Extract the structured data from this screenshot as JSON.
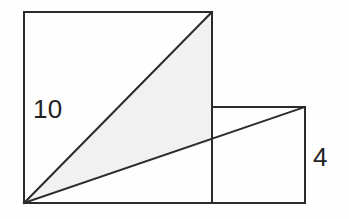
{
  "figure": {
    "kind": "geometry-diagram",
    "canvas": {
      "width": 349,
      "height": 219
    },
    "colors": {
      "background": "#fefefe",
      "stroke": "#2b2b2b",
      "shade_fill": "#f1f1f1",
      "label": "#232323"
    },
    "stroke_width": 2,
    "shapes": {
      "square": {
        "name": "large-square",
        "x": 24,
        "y": 12,
        "width": 188,
        "height": 191,
        "side_label": "10",
        "fill": "none"
      },
      "rectangle": {
        "name": "small-rectangle",
        "x": 212,
        "y": 107,
        "width": 93,
        "height": 96,
        "side_label": "4",
        "fill": "none"
      },
      "shaded_triangle": {
        "name": "shaded-triangle",
        "points": "24,203 212,12 212,141",
        "fill": "#f1f1f1"
      }
    },
    "lines": {
      "square_diagonal": {
        "name": "square-diagonal",
        "x1": 24,
        "y1": 203,
        "x2": 212,
        "y2": 12
      },
      "long_diagonal": {
        "name": "long-diagonal",
        "x1": 24,
        "y1": 203,
        "x2": 305,
        "y2": 107
      },
      "shared_vertical_edge": {
        "name": "shared-vertical-edge",
        "x1": 212,
        "y1": 107,
        "x2": 212,
        "y2": 203
      },
      "baseline": {
        "name": "figure-baseline",
        "x1": 24,
        "y1": 203,
        "x2": 305,
        "y2": 203
      }
    },
    "labels": {
      "square_side": {
        "name": "square-side-label",
        "text": "10",
        "x": 33,
        "y": 118
      },
      "rectangle_side": {
        "name": "rectangle-side-label",
        "text": "4",
        "x": 313,
        "y": 166
      }
    }
  }
}
